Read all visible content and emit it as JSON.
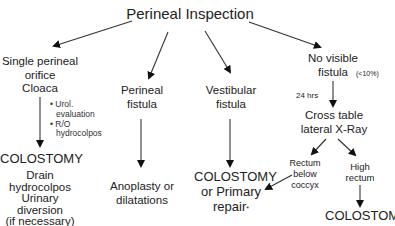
{
  "title": "Perineal Inspection",
  "branches": {
    "cloaca": {
      "heading": [
        "Single perineal",
        "orifice"
      ],
      "name": "Cloaca",
      "notes": [
        "• Urol.",
        "  evaluation",
        "• R/O",
        "  hydrocolpos"
      ],
      "outcome": "COLOSTOMY",
      "details": [
        "Drain",
        "hydrocolpos",
        "Urinary",
        "diversion",
        "(if necessary)"
      ]
    },
    "perineal": {
      "heading": [
        "Perineal",
        "fistula"
      ],
      "outcome": [
        "Anoplasty or",
        "dilatations"
      ]
    },
    "vestibular": {
      "heading": [
        "Vestibular",
        "fistula"
      ],
      "outcome": [
        "COLOSTOMY",
        "or Primary",
        "repair"
      ],
      "outcome_mark": "*"
    },
    "no_fistula": {
      "heading": [
        "No visible",
        "fistula"
      ],
      "percent": "(<10%)",
      "wait": "24 hrs",
      "test": [
        "Cross table",
        "lateral X-Ray"
      ],
      "low": [
        "Rectum",
        "below",
        "coccyx"
      ],
      "high": [
        "High",
        "rectum"
      ],
      "high_outcome": "COLOSTOMY"
    }
  }
}
